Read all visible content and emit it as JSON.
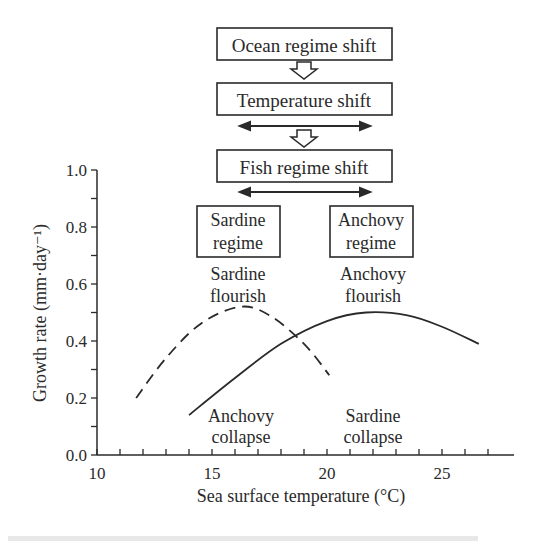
{
  "flow": {
    "box1": "Ocean regime shift",
    "box2": "Temperature shift",
    "box3": "Fish regime shift",
    "sardine_regime": [
      "Sardine",
      "regime"
    ],
    "anchovy_regime": [
      "Anchovy",
      "regime"
    ]
  },
  "annotations": {
    "sardine_flourish": [
      "Sardine",
      "flourish"
    ],
    "anchovy_flourish": [
      "Anchovy",
      "flourish"
    ],
    "anchovy_collapse": [
      "Anchovy",
      "collapse"
    ],
    "sardine_collapse": [
      "Sardine",
      "collapse"
    ]
  },
  "chart_data": {
    "type": "line",
    "title": "",
    "xlabel": "Sea surface temperature (°C)",
    "ylabel": "Growth rate (mm·day⁻¹)",
    "xlim": [
      10,
      27
    ],
    "ylim": [
      0.0,
      1.0
    ],
    "xticks": [
      "10",
      "15",
      "20",
      "25"
    ],
    "yticks": [
      "0.0",
      "0.2",
      "0.4",
      "0.6",
      "0.8",
      "1.0"
    ],
    "grid": false,
    "series": [
      {
        "name": "Sardine",
        "style": "dashed",
        "x": [
          11.7,
          13.0,
          14.5,
          16.2,
          17.5,
          19.0,
          20.1
        ],
        "y": [
          0.2,
          0.34,
          0.46,
          0.52,
          0.49,
          0.39,
          0.28
        ]
      },
      {
        "name": "Anchovy",
        "style": "solid",
        "x": [
          14.0,
          16.0,
          18.0,
          20.0,
          21.7,
          23.5,
          25.0,
          26.6
        ],
        "y": [
          0.14,
          0.27,
          0.39,
          0.47,
          0.5,
          0.49,
          0.45,
          0.39
        ]
      }
    ]
  }
}
